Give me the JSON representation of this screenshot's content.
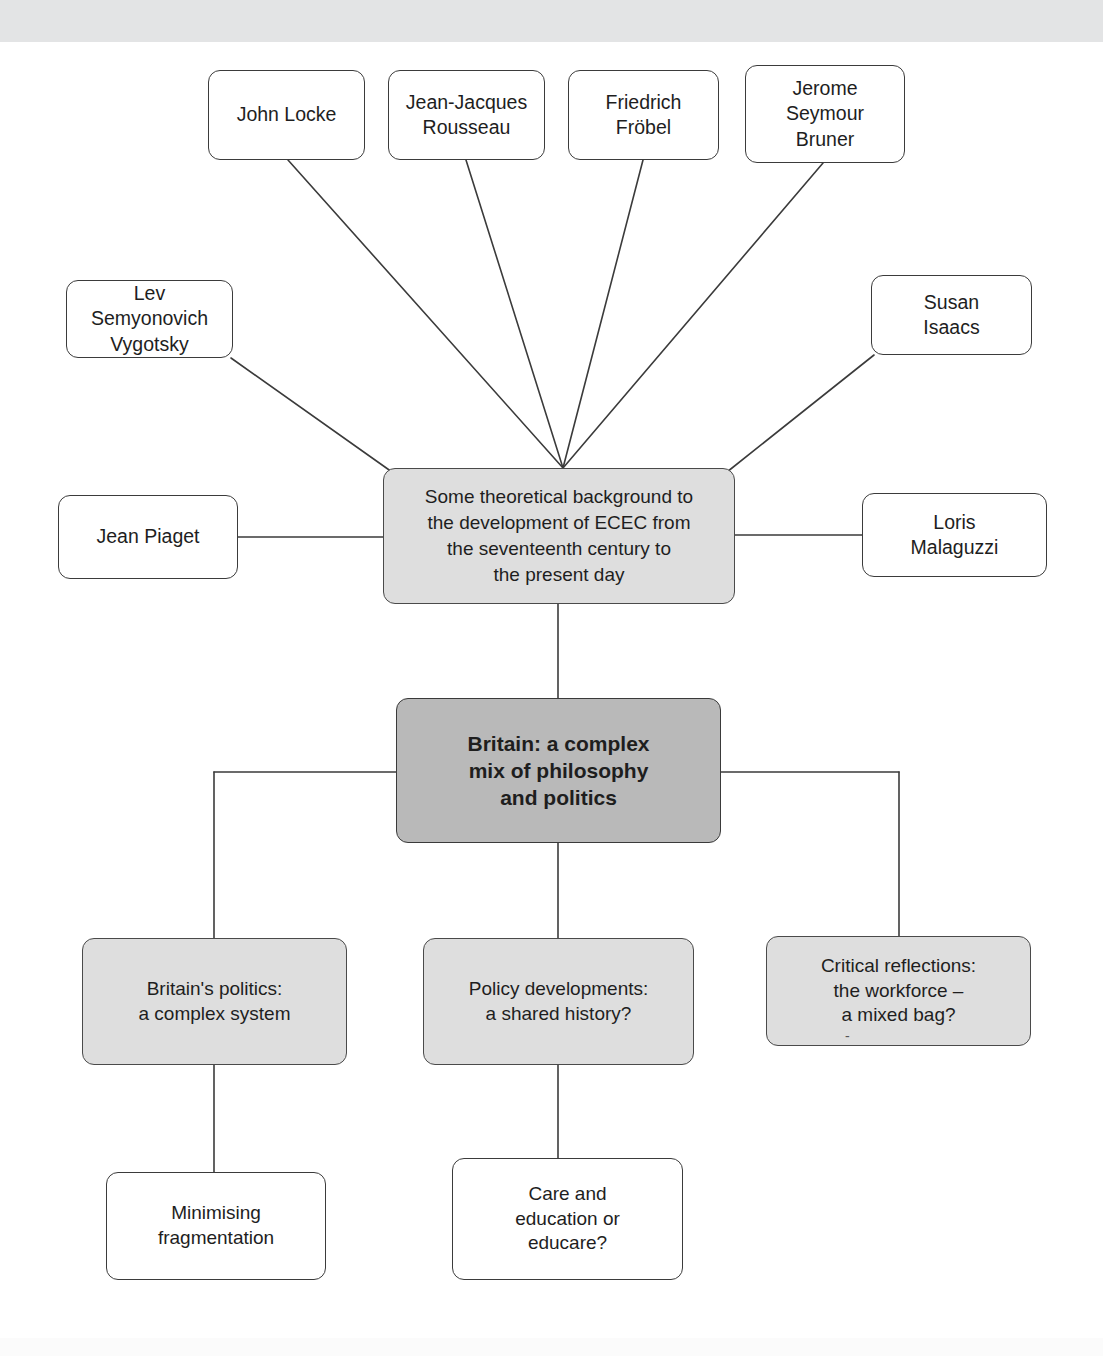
{
  "page": {
    "title": "Some theoretical background to the development of ECEC from the seventeenth century to the present day",
    "background_color": "#ffffff",
    "band_color": "#e3e4e5"
  },
  "colors": {
    "node_fill_white": "#ffffff",
    "node_fill_light": "#dedede",
    "node_fill_dark": "#b9b9b9",
    "node_border": "#3b3b3b",
    "connector": "#3b3b3b",
    "text": "#1e1e1e"
  },
  "diagram": {
    "type": "concept-map",
    "hub": {
      "id": "hub",
      "label": "Some theoretical background to\nthe development of ECEC from\nthe seventeenth century to\nthe present day",
      "fill": "light",
      "x": 383,
      "y": 468,
      "w": 352,
      "h": 136
    },
    "theorists": [
      {
        "id": "john-locke",
        "label": "John Locke",
        "x": 208,
        "y": 70,
        "w": 157,
        "h": 90
      },
      {
        "id": "rousseau",
        "label": "Jean-Jacques\nRousseau",
        "x": 388,
        "y": 70,
        "w": 157,
        "h": 90
      },
      {
        "id": "frobel",
        "label": "Friedrich\nFröbel",
        "x": 568,
        "y": 70,
        "w": 151,
        "h": 90
      },
      {
        "id": "bruner",
        "label": "Jerome\nSeymour\nBruner",
        "x": 745,
        "y": 65,
        "w": 160,
        "h": 98
      },
      {
        "id": "vygotsky",
        "label": "Lev Semyonovich\nVygotsky",
        "x": 66,
        "y": 280,
        "w": 167,
        "h": 78
      },
      {
        "id": "susan-isaacs",
        "label": "Susan\nIsaacs",
        "x": 871,
        "y": 275,
        "w": 161,
        "h": 80
      },
      {
        "id": "jean-piaget",
        "label": "Jean Piaget",
        "x": 58,
        "y": 495,
        "w": 180,
        "h": 84
      },
      {
        "id": "loris-malaguzzi",
        "label": "Loris\nMalaguzzi",
        "x": 862,
        "y": 493,
        "w": 185,
        "h": 84
      }
    ],
    "britain": {
      "id": "britain",
      "label": "Britain: a complex\nmix of philosophy\nand politics",
      "fill": "dark",
      "x": 396,
      "y": 698,
      "w": 325,
      "h": 145
    },
    "branches": [
      {
        "id": "britains-politics",
        "label": "Britain's politics:\na complex system",
        "fill": "light",
        "x": 82,
        "y": 938,
        "w": 265,
        "h": 127,
        "child": {
          "id": "minimising-fragmentation",
          "label": "Minimising\nfragmentation",
          "fill": "white",
          "x": 106,
          "y": 1172,
          "w": 220,
          "h": 108
        }
      },
      {
        "id": "policy-developments",
        "label": "Policy developments:\na shared history?",
        "fill": "light",
        "x": 423,
        "y": 938,
        "w": 271,
        "h": 127,
        "child": {
          "id": "care-and-education",
          "label": "Care and\neducation or\neducare?",
          "fill": "white",
          "x": 452,
          "y": 1158,
          "w": 231,
          "h": 122
        }
      },
      {
        "id": "critical-reflections",
        "label": "Critical reflections:\nthe workforce –\na mixed bag?",
        "fill": "light",
        "x": 766,
        "y": 936,
        "w": 265,
        "h": 110,
        "clipped_text": "-",
        "child": null
      }
    ]
  }
}
